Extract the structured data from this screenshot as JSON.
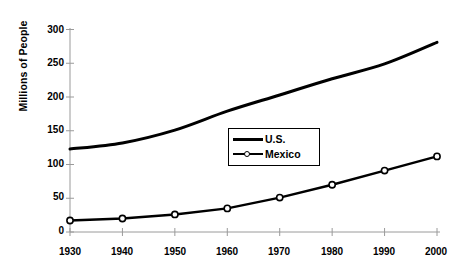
{
  "chart_data": {
    "type": "line",
    "title": "",
    "xlabel": "",
    "ylabel": "Millions of People",
    "categories": [
      "1930",
      "1940",
      "1950",
      "1960",
      "1970",
      "1980",
      "1990",
      "2000"
    ],
    "x": [
      1930,
      1940,
      1950,
      1960,
      1970,
      1980,
      1990,
      2000
    ],
    "xlim": [
      1930,
      2000
    ],
    "ylim": [
      0,
      300
    ],
    "grid": false,
    "legend_position": "center-right",
    "y_ticks": [
      0,
      50,
      100,
      150,
      200,
      250,
      300
    ],
    "x_ticks": [
      1930,
      1940,
      1950,
      1960,
      1970,
      1980,
      1990,
      2000
    ],
    "series": [
      {
        "name": "U.S.",
        "marker": "none",
        "color": "#000000",
        "line_width": 3,
        "values": [
          123,
          132,
          151,
          179,
          203,
          227,
          249,
          281
        ]
      },
      {
        "name": "Mexico",
        "marker": "open-circle",
        "color": "#000000",
        "line_width": 2.4,
        "values": [
          17,
          20,
          26,
          35,
          51,
          70,
          91,
          112
        ]
      }
    ]
  },
  "axis": {
    "y_title": "Millions of People",
    "y_tick_labels": [
      "300",
      "250",
      "200",
      "150",
      "100",
      "50",
      "0"
    ],
    "x_tick_labels": [
      "1930",
      "1940",
      "1950",
      "1960",
      "1970",
      "1980",
      "1990",
      "2000"
    ]
  },
  "legend": {
    "entries": [
      {
        "label": "U.S."
      },
      {
        "label": "Mexico"
      }
    ]
  }
}
